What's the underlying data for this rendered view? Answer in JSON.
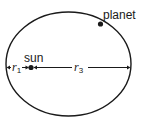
{
  "diagram": {
    "labels": {
      "planet": "planet",
      "sun": "sun",
      "r1_var": "r",
      "r1_sub": "1",
      "r3_var": "r",
      "r3_sub": "3"
    },
    "colors": {
      "stroke": "#1a1a1a",
      "background": "#ffffff"
    }
  }
}
